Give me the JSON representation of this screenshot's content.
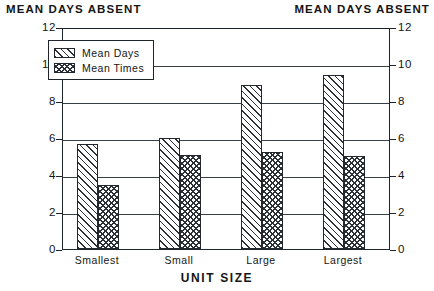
{
  "chart_data": {
    "type": "bar",
    "title": "",
    "xlabel": "UNIT SIZE",
    "ylabel": "MEAN DAYS ABSENT",
    "ylabel_right": "MEAN DAYS ABSENT",
    "categories": [
      "Smallest",
      "Small",
      "Large",
      "Largest"
    ],
    "series": [
      {
        "name": "Mean Days",
        "values": [
          5.7,
          6.0,
          8.85,
          9.4
        ],
        "pattern": "diagonal-hatch"
      },
      {
        "name": "Mean Times",
        "values": [
          3.45,
          5.1,
          5.25,
          5.05
        ],
        "pattern": "cross-hatch"
      }
    ],
    "ylim": [
      0,
      12
    ],
    "yticks": [
      0,
      2,
      4,
      6,
      8,
      10,
      12
    ],
    "ytick_labels": [
      "0",
      "2",
      "4",
      "6",
      "8",
      "10",
      "12"
    ],
    "grid": true,
    "legend_position": "upper-left-inside",
    "dual_y_axis": true
  }
}
